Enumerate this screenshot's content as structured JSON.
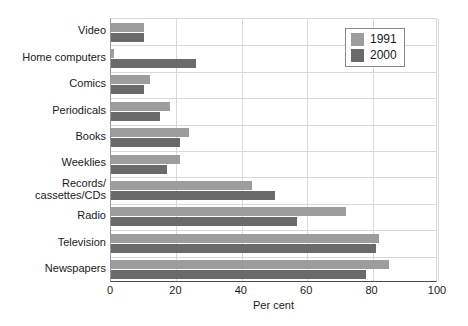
{
  "chart_data": {
    "type": "bar",
    "orientation": "horizontal",
    "title": "",
    "xlabel": "Per cent",
    "ylabel": "",
    "xlim": [
      0,
      100
    ],
    "xticks": [
      0,
      20,
      40,
      60,
      80,
      100
    ],
    "grid": true,
    "legend_position": "top-right",
    "categories": [
      "Video",
      "Home computers",
      "Comics",
      "Periodicals",
      "Books",
      "Weeklies",
      "Records/ cassettes/CDs",
      "Radio",
      "Television",
      "Newspapers"
    ],
    "category_lines": [
      [
        "Video"
      ],
      [
        "Home computers"
      ],
      [
        "Comics"
      ],
      [
        "Periodicals"
      ],
      [
        "Books"
      ],
      [
        "Weeklies"
      ],
      [
        "Records/",
        "cassettes/CDs"
      ],
      [
        "Radio"
      ],
      [
        "Television"
      ],
      [
        "Newspapers"
      ]
    ],
    "series": [
      {
        "name": "1991",
        "color": "#9d9d9d",
        "values": [
          10,
          1,
          12,
          18,
          24,
          21,
          43,
          72,
          82,
          85
        ]
      },
      {
        "name": "2000",
        "color": "#6a6a6a",
        "values": [
          10,
          26,
          10,
          15,
          21,
          17,
          50,
          57,
          81,
          78
        ]
      }
    ]
  },
  "legend": {
    "items": [
      {
        "label": "1991",
        "color": "#9d9d9d"
      },
      {
        "label": "2000",
        "color": "#6a6a6a"
      }
    ]
  },
  "axis": {
    "x_title": "Per cent",
    "x_tick_labels": [
      "0",
      "20",
      "40",
      "60",
      "80",
      "100"
    ]
  }
}
